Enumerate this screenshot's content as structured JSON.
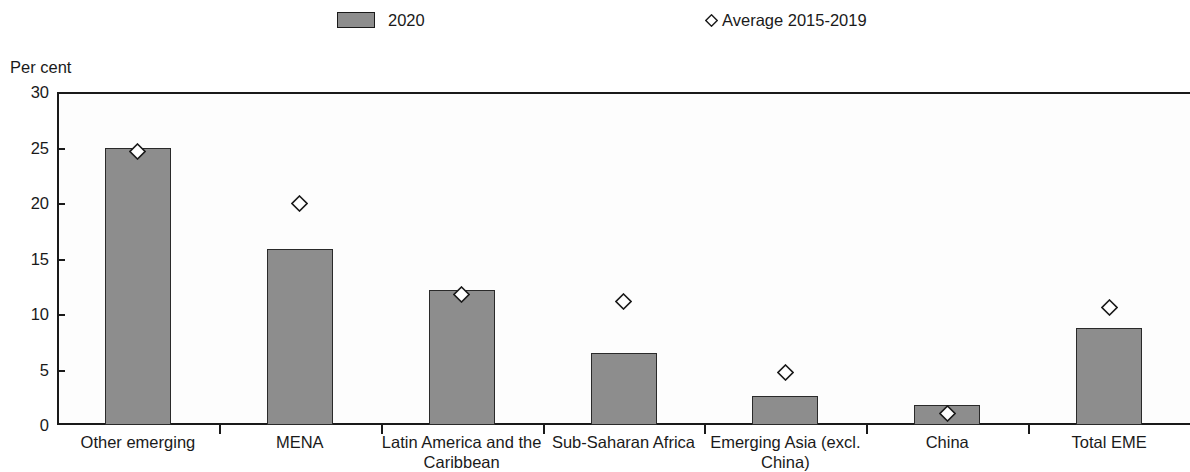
{
  "legend": {
    "items": [
      {
        "label": "2020",
        "marker": "bar-swatch-icon",
        "color": "#8d8d8d"
      },
      {
        "label": "Average 2015-2019",
        "marker": "diamond-icon",
        "color": "#ffffff"
      }
    ]
  },
  "axis": {
    "y_title": "Per cent",
    "y_ticks": [
      "30",
      "25",
      "20",
      "15",
      "10",
      "5",
      "0"
    ]
  },
  "chart_data": {
    "type": "bar",
    "title": "",
    "subtitle": "",
    "xlabel": "",
    "ylabel": "Per cent",
    "ylim": [
      0,
      30
    ],
    "ytick_values": [
      0,
      5,
      10,
      15,
      20,
      25,
      30
    ],
    "grid": false,
    "legend_position": "top",
    "categories": [
      "Other emerging",
      "MENA",
      "Latin America and the Caribbean",
      "Sub-Saharan Africa",
      "Emerging Asia (excl. China)",
      "China",
      "Total EME"
    ],
    "series": [
      {
        "name": "2020",
        "type": "bar",
        "color": "#8d8d8d",
        "values": [
          25.0,
          15.9,
          12.2,
          6.5,
          2.6,
          1.8,
          8.7
        ]
      },
      {
        "name": "Average 2015-2019",
        "type": "scatter",
        "marker": "diamond",
        "color": "#ffffff",
        "values": [
          24.6,
          20.0,
          11.8,
          11.1,
          4.7,
          1.0,
          10.6
        ]
      }
    ]
  }
}
